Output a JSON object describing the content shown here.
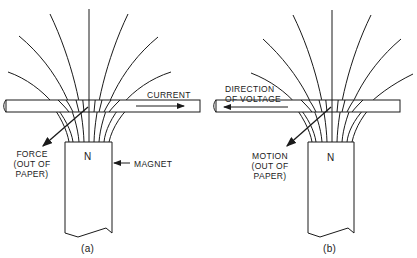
{
  "figure": {
    "panels": [
      {
        "id": "a",
        "caption": "(a)",
        "pole_label": "N",
        "magnet_label": "MAGNET",
        "conductor_label": "CURRENT",
        "conductor_arrow_direction": "right",
        "vector_label_lines": [
          "FORCE",
          "(OUT OF",
          "PAPER)"
        ]
      },
      {
        "id": "b",
        "caption": "(b)",
        "pole_label": "N",
        "conductor_label_lines": [
          "DIRECTION",
          "OF VOLTAGE"
        ],
        "conductor_arrow_direction": "left",
        "vector_label_lines": [
          "MOTION",
          "(OUT OF",
          "PAPER)"
        ]
      }
    ],
    "colors": {
      "ink": "#1a1a1a",
      "background": "#ffffff"
    }
  }
}
